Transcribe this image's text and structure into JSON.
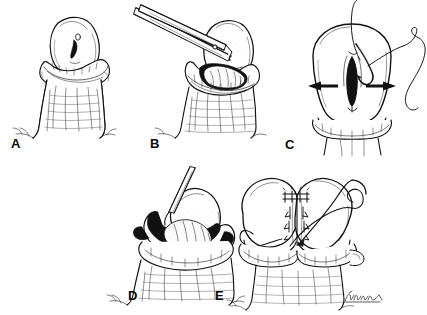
{
  "figure": {
    "type": "line-art-medical-illustration",
    "medium": "pen-and-ink stipple and hatch drawing",
    "background_color": "#ffffff",
    "ink_color": "#111111",
    "width": 427,
    "height": 315,
    "border": "none",
    "caption": "",
    "title": "",
    "layout": {
      "rows": 2,
      "row_1_panels": [
        "A",
        "B",
        "C"
      ],
      "row_2_panels": [
        "D",
        "E"
      ],
      "row_2_alignment": "center"
    },
    "signature": {
      "present": true,
      "text": "",
      "description": "artist cursive signature, illegible",
      "panel": "E",
      "position": "bottom-right"
    }
  },
  "panels": [
    {
      "id": "A",
      "label": "A",
      "label_x": 11,
      "label_y": 137,
      "view": "lateral",
      "description": "Shaft with retracted prepuce forming a collar beneath the glans; glans shown intact with meatus visible."
    },
    {
      "id": "B",
      "label": "B",
      "label_x": 150,
      "label_y": 137,
      "view": "lateral",
      "description": "Straight scissors introduced from upper left incising the dorsal aspect; cut tissue edges retracted.",
      "instrument": "scissors"
    },
    {
      "id": "C",
      "label": "C",
      "label_x": 285,
      "label_y": 138,
      "view": "frontal",
      "description": "Frontal view of the opened vertical slit; paired horizontal arrows indicate lateral spreading; curved needle with long suture thread enters from upper right.",
      "annotations": [
        "left-pointing arrow",
        "right-pointing arrow"
      ],
      "instrument": "curved needle with suture"
    },
    {
      "id": "D",
      "label": "D",
      "label_x": 128,
      "label_y": 289,
      "view": "lateral-oblique",
      "description": "Incision held open by a fine instrument from above exposing the underlying tissue planes; heavy shading in the defect.",
      "instrument": "fine forceps or probe"
    },
    {
      "id": "E",
      "label": "E",
      "label_x": 215,
      "label_y": 289,
      "view": "frontal",
      "description": "Completed transverse closure with interrupted sutures placed across the defect; curved needle and thread loop shown at right; small arrows mark the approximation direction.",
      "instrument": "curved needle with suture"
    }
  ],
  "labels": {
    "a": "A",
    "b": "B",
    "c": "C",
    "d": "D",
    "e": "E"
  }
}
